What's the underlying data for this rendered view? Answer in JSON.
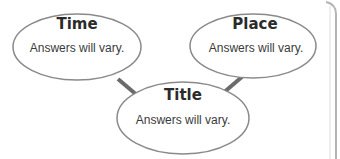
{
  "diagram": {
    "type": "graphic-organizer",
    "nodes": [
      {
        "id": "time",
        "label": "Time",
        "text": "Answers will vary."
      },
      {
        "id": "place",
        "label": "Place",
        "text": "Answers will vary."
      },
      {
        "id": "title",
        "label": "Title",
        "text": "Answers will vary."
      }
    ],
    "edges": [
      {
        "from": "time",
        "to": "title"
      },
      {
        "from": "place",
        "to": "title"
      }
    ],
    "colors": {
      "ellipse_fill": "#ffffff",
      "ellipse_stroke": "#8a8a8a",
      "connector": "#6b6b6b",
      "frame": "#b5b5b5"
    }
  }
}
